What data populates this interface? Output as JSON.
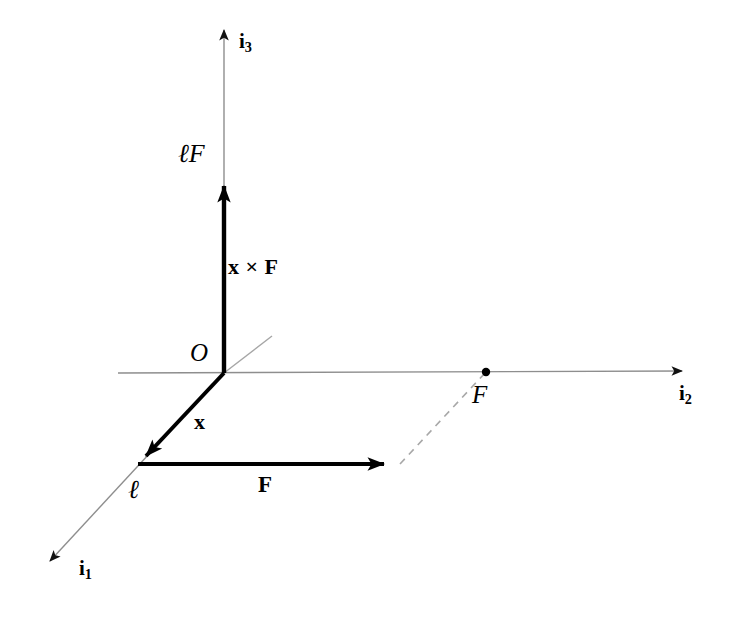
{
  "figure": {
    "background_color": "#ffffff",
    "width": 732,
    "height": 619,
    "axis_color": "#808080",
    "vector_color": "#000000",
    "dash_color": "#9a9a9a"
  },
  "axes": [
    {
      "id": "i1",
      "label": "i",
      "subscript": "1",
      "description": "axis directed out of page toward lower-left",
      "from": [
        272,
        336
      ],
      "to": [
        42,
        568
      ],
      "arrow_at": "to",
      "style": "thin"
    },
    {
      "id": "i2",
      "label": "i",
      "subscript": "2",
      "description": "horizontal axis directed to the right",
      "from": [
        118,
        373
      ],
      "to": [
        690,
        371
      ],
      "arrow_at": "to",
      "style": "thin"
    },
    {
      "id": "i3",
      "label": "i",
      "subscript": "3",
      "description": "vertical axis directed upward",
      "from": [
        224,
        373
      ],
      "to": [
        224,
        22
      ],
      "arrow_at": "to",
      "style": "thin"
    }
  ],
  "points": [
    {
      "id": "O",
      "label": "O",
      "style": "italic",
      "at": [
        224,
        373
      ],
      "marker": false
    },
    {
      "id": "ell",
      "label": "ℓ",
      "style": "italic",
      "at": [
        138,
        464
      ],
      "marker": false
    },
    {
      "id": "F_point",
      "label": "F",
      "style": "italic",
      "at": [
        486,
        372
      ],
      "marker": true
    }
  ],
  "vectors": [
    {
      "id": "moment",
      "label": "x × F",
      "style": "bold",
      "from": [
        224,
        373
      ],
      "to": [
        224,
        168
      ],
      "tip_label": "ℓF",
      "tip_label_style": "italic"
    },
    {
      "id": "position",
      "label": "x",
      "style": "bold",
      "from": [
        224,
        373
      ],
      "to": [
        138,
        464
      ]
    },
    {
      "id": "force",
      "label": "F",
      "style": "bold",
      "from": [
        138,
        464
      ],
      "to": [
        400,
        464
      ]
    }
  ],
  "construction_lines": [
    {
      "id": "projection",
      "style": "dashed",
      "from": [
        400,
        464
      ],
      "to": [
        486,
        372
      ],
      "description": "dashed projection from force arrowhead to point F on the i2 axis"
    }
  ],
  "labels": {
    "lF": "ℓF",
    "x_cross_F": "x × F",
    "O": "O",
    "x": "x",
    "ell": "ℓ",
    "F_vector": "F",
    "F_point": "F",
    "i1": "i",
    "i1_sub": "1",
    "i2": "i",
    "i2_sub": "2",
    "i3": "i",
    "i3_sub": "3"
  }
}
